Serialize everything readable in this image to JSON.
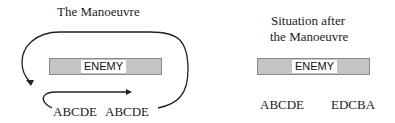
{
  "left_panel": {
    "title": "The Manoeuvre",
    "enemy_label": "ENEMY",
    "units_left": "ABCDE",
    "units_right": "ABCDE"
  },
  "right_panel": {
    "title_line1": "Situation after",
    "title_line2": "the Manoeuvre",
    "enemy_label": "ENEMY",
    "units_left": "ABCDE",
    "units_right": "EDCBA"
  },
  "colors": {
    "enemy_fill": "#c4c4c4",
    "enemy_border": "#8a8a8a",
    "arrow": "#222222"
  }
}
